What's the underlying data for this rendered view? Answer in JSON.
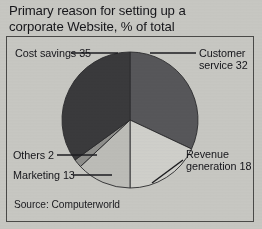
{
  "figure": {
    "title": "Primary reason for setting up a corporate Website, % of total",
    "title_line1": "Primary reason for setting up a",
    "title_line2": "corporate Website, % of total",
    "source": "Source: Computerworld",
    "background_color": "#c8c8c3",
    "border_color": "#4a4a48",
    "text_color": "#15151a"
  },
  "chart_data": {
    "type": "pie",
    "title": "Primary reason for setting up a corporate Website, % of total",
    "unit": "% of total",
    "xlabel": "",
    "ylabel": "",
    "legend_position": "callout-labels",
    "grid": false,
    "total": 100,
    "categories": [
      "Customer service",
      "Revenue generation",
      "Marketing",
      "Others",
      "Cost savings"
    ],
    "values": [
      32,
      18,
      13,
      2,
      35
    ],
    "slices": [
      {
        "label": "Customer service",
        "value": 32,
        "label_text": "Customer service 32",
        "label_line1": "Customer",
        "label_line2": "service 32",
        "color": "#57575a",
        "start_angle_deg": 0,
        "end_angle_deg": 115.2
      },
      {
        "label": "Revenue generation",
        "value": 18,
        "label_text": "Revenue generation 18",
        "label_line1": "Revenue",
        "label_line2": "generation 18",
        "color": "#d0d0cb",
        "start_angle_deg": 115.2,
        "end_angle_deg": 180.0
      },
      {
        "label": "Marketing",
        "value": 13,
        "label_text": "Marketing 13",
        "color": "#bdbdb8",
        "start_angle_deg": 180.0,
        "end_angle_deg": 226.8
      },
      {
        "label": "Others",
        "value": 2,
        "label_text": "Others 2",
        "color": "#8f8f8c",
        "start_angle_deg": 226.8,
        "end_angle_deg": 234.0
      },
      {
        "label": "Cost savings",
        "value": 35,
        "label_text": "Cost savings 35",
        "color": "#3a3a3c",
        "start_angle_deg": 234.0,
        "end_angle_deg": 360.0
      }
    ],
    "geometry": {
      "center_x": 130,
      "center_y": 120,
      "radius": 68
    }
  },
  "labels": {
    "cost_savings": "Cost savings 35",
    "customer_service_line1": "Customer",
    "customer_service_line2": "service 32",
    "revenue_line1": "Revenue",
    "revenue_line2": "generation 18",
    "others": "Others 2",
    "marketing": "Marketing 13"
  }
}
